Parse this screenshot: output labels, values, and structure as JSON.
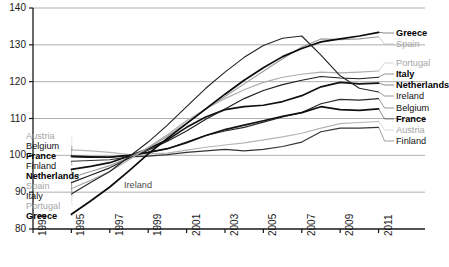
{
  "chart_data": {
    "type": "line",
    "title": "",
    "subtitle": "",
    "xlabel": "",
    "ylabel": "",
    "xlim": [
      1993,
      2011.7
    ],
    "ylim": [
      80,
      140
    ],
    "yticks": [
      80,
      90,
      100,
      110,
      120,
      130,
      140
    ],
    "xticks": [
      1993,
      1995,
      1997,
      1999,
      2001,
      2003,
      2005,
      2007,
      2009,
      2011
    ],
    "grid": "horizontal",
    "legend_position": "inline-left-and-right",
    "annotations": [
      {
        "text": "Ireland",
        "x": 1997.3,
        "y": 92.5
      }
    ],
    "x": [
      1995,
      1996,
      1997,
      1998,
      1999,
      2000,
      2001,
      2002,
      2003,
      2004,
      2005,
      2006,
      2007,
      2008,
      2009,
      2010,
      2011
    ],
    "series": [
      {
        "name": "Austria",
        "color": "#b5b5b5",
        "weight": "normal",
        "left_label": "Austria",
        "right_label": "Austria",
        "left_value": 101.5,
        "right_value": 109.0,
        "values": [
          101.5,
          101.2,
          100.8,
          100.2,
          100.4,
          100.6,
          101.4,
          102.2,
          102.8,
          103.4,
          104.2,
          105.0,
          106.0,
          107.4,
          108.6,
          108.9,
          109.2
        ]
      },
      {
        "name": "Belgium",
        "color": "#2b2b2b",
        "weight": "normal",
        "left_label": "Belgium",
        "right_label": "Belgium",
        "left_value": 99.6,
        "right_value": 115.2,
        "values": [
          99.6,
          99.4,
          99.5,
          100.0,
          100.8,
          101.8,
          103.6,
          105.4,
          106.6,
          107.6,
          109.0,
          110.4,
          111.6,
          114.0,
          115.2,
          115.0,
          115.4
        ]
      },
      {
        "name": "France",
        "color": "#111111",
        "weight": "bold",
        "left_label": "France",
        "right_label": "France",
        "left_value": 99.8,
        "right_value": 112.4,
        "values": [
          99.8,
          99.6,
          99.5,
          100.0,
          100.8,
          101.8,
          103.4,
          105.4,
          107.0,
          108.2,
          109.4,
          110.6,
          111.6,
          113.2,
          112.4,
          112.2,
          112.6
        ]
      },
      {
        "name": "Finland",
        "color": "#333333",
        "weight": "normal",
        "left_label": "Finland",
        "right_label": "Finland",
        "left_value": 98.4,
        "right_value": 107.5,
        "values": [
          98.4,
          98.6,
          98.8,
          99.6,
          99.8,
          100.2,
          100.8,
          101.2,
          101.6,
          101.2,
          101.6,
          102.4,
          103.6,
          106.4,
          107.4,
          107.4,
          107.6
        ]
      },
      {
        "name": "Netherlands",
        "color": "#111111",
        "weight": "bold",
        "left_label": "Netherlands",
        "right_label": "Netherlands",
        "left_value": 96.2,
        "right_value": 119.5,
        "values": [
          96.2,
          97.0,
          98.0,
          99.8,
          101.8,
          104.2,
          107.6,
          110.4,
          112.4,
          113.2,
          113.6,
          114.6,
          116.2,
          118.6,
          119.8,
          119.4,
          119.6
        ]
      },
      {
        "name": "Spain",
        "color": "#9a9a9a",
        "weight": "normal",
        "left_label": "Spain",
        "right_label": "Spain",
        "left_value": 94.0,
        "right_value": 132.0,
        "values": [
          94.0,
          95.6,
          97.2,
          99.4,
          102.0,
          105.2,
          108.8,
          112.6,
          116.0,
          119.4,
          122.8,
          126.2,
          129.4,
          131.6,
          131.4,
          131.6,
          132.2
        ]
      },
      {
        "name": "Italy",
        "color": "#1f1f1f",
        "weight": "normal",
        "left_label": "Italy",
        "right_label": "Italy",
        "left_value": 92.6,
        "right_value": 121.0,
        "values": [
          92.6,
          94.6,
          96.6,
          99.2,
          101.4,
          103.8,
          106.6,
          109.8,
          112.6,
          115.4,
          117.6,
          119.2,
          120.4,
          121.4,
          121.0,
          120.8,
          121.2
        ]
      },
      {
        "name": "Portugal",
        "color": "#adadad",
        "weight": "normal",
        "left_label": "Portugal",
        "right_label": "Portugal",
        "left_value": 91.0,
        "right_value": 122.8,
        "values": [
          91.0,
          93.2,
          95.6,
          98.8,
          102.2,
          105.6,
          109.4,
          112.6,
          115.4,
          117.8,
          119.8,
          121.2,
          122.0,
          122.6,
          122.4,
          122.6,
          122.9
        ]
      },
      {
        "name": "Greece",
        "color": "#0a0a0a",
        "weight": "bold",
        "left_label": "Greece",
        "right_label": "Greece",
        "left_value": 84.0,
        "right_value": 133.2,
        "values": [
          84.0,
          87.6,
          91.4,
          95.8,
          100.4,
          104.6,
          108.6,
          112.6,
          116.6,
          120.4,
          123.8,
          126.8,
          129.0,
          130.8,
          131.6,
          132.4,
          133.4
        ]
      },
      {
        "name": "Ireland",
        "color": "#262626",
        "weight": "normal",
        "left_label": "",
        "right_label": "Ireland",
        "left_value": 89.5,
        "right_value": 117.0,
        "values": [
          89.5,
          92.6,
          95.6,
          99.6,
          103.6,
          108.2,
          113.2,
          118.2,
          122.6,
          126.6,
          129.8,
          131.8,
          132.4,
          127.2,
          121.6,
          118.2,
          117.2
        ]
      }
    ]
  },
  "axes": {
    "y_ticks": [
      "80",
      "90",
      "100",
      "110",
      "120",
      "130",
      "140"
    ],
    "x_ticks": [
      "1993",
      "1995",
      "1997",
      "1999",
      "2001",
      "2003",
      "2005",
      "2007",
      "2009",
      "2011"
    ]
  },
  "labels": {
    "left": [
      {
        "text": "Austria",
        "style": "lbl-gray",
        "top": 131
      },
      {
        "text": "Belgium",
        "style": "lbl-black",
        "top": 141
      },
      {
        "text": "France",
        "style": "lbl-bold",
        "top": 151
      },
      {
        "text": "Finland",
        "style": "lbl-black",
        "top": 161
      },
      {
        "text": "Netherlands",
        "style": "lbl-bold",
        "top": 171
      },
      {
        "text": "Spain",
        "style": "lbl-gray",
        "top": 181
      },
      {
        "text": "Italy",
        "style": "lbl-black",
        "top": 191
      },
      {
        "text": "Portugal",
        "style": "lbl-gray",
        "top": 201
      },
      {
        "text": "Greece",
        "style": "lbl-bold",
        "top": 211
      }
    ],
    "right": [
      {
        "text": "Greece",
        "style": "lbl-bold",
        "top": 28
      },
      {
        "text": "Spain",
        "style": "lbl-gray",
        "top": 39
      },
      {
        "text": "Portugal",
        "style": "lbl-gray",
        "top": 58
      },
      {
        "text": "Italy",
        "style": "lbl-bold",
        "top": 69
      },
      {
        "text": "Netherlands",
        "style": "lbl-bold",
        "top": 80
      },
      {
        "text": "Ireland",
        "style": "lbl-black",
        "top": 91
      },
      {
        "text": "Belgium",
        "style": "lbl-black",
        "top": 103
      },
      {
        "text": "France",
        "style": "lbl-bold",
        "top": 114
      },
      {
        "text": "Austria",
        "style": "lbl-gray",
        "top": 125
      },
      {
        "text": "Finland",
        "style": "lbl-black",
        "top": 136
      }
    ],
    "inner": [
      {
        "text": "Ireland",
        "left": 124,
        "top": 180
      }
    ]
  },
  "colors": {
    "axis": "#1a1a1a",
    "grid": "#9b9b9b",
    "background": "#ffffff"
  }
}
